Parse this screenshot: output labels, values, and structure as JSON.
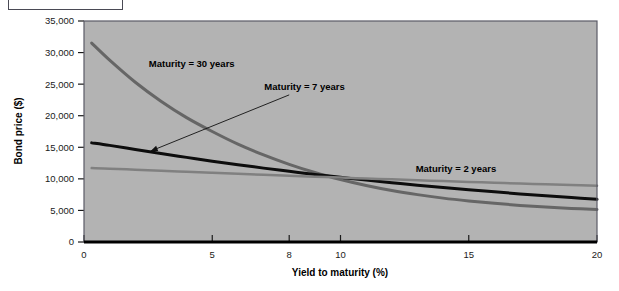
{
  "figure": {
    "background_color": "#ffffff",
    "plot_background_color": "#b3b3b3",
    "plot_border_color": "#5a5a66",
    "label_box_present": true
  },
  "chart_data": {
    "type": "line",
    "title": "",
    "xlabel": "Yield to maturity (%)",
    "ylabel": "Bond price ($)",
    "xlim": [
      0,
      20
    ],
    "ylim": [
      0,
      35000
    ],
    "xticks": [
      0,
      5,
      8,
      10,
      15,
      20
    ],
    "xticklabels": [
      "0",
      "5",
      "8",
      "10",
      "15",
      "20"
    ],
    "yticks": [
      0,
      5000,
      10000,
      15000,
      20000,
      25000,
      30000,
      35000
    ],
    "yticklabels": [
      "0",
      "5,000",
      "10,000",
      "15,000",
      "20,000",
      "25,000",
      "30,000",
      "35,000"
    ],
    "grid": false,
    "legend_position": "inline-annotations",
    "series": [
      {
        "name": "Maturity = 30 years",
        "color": "#666666",
        "line_width": 3,
        "label_x": 4.2,
        "label_y": 28200,
        "x": [
          0.3,
          1,
          2,
          3,
          4,
          5,
          6,
          7,
          8,
          9,
          10,
          11,
          12,
          13,
          14,
          15,
          16,
          17,
          18,
          19,
          20
        ],
        "y": [
          31500,
          28800,
          25300,
          22300,
          19700,
          17500,
          15500,
          13800,
          12300,
          11000,
          9900,
          8950,
          8150,
          7500,
          6950,
          6500,
          6120,
          5800,
          5540,
          5320,
          5150
        ]
      },
      {
        "name": "Maturity = 7 years",
        "color": "#0d0d0d",
        "line_width": 3,
        "label_x": 8.6,
        "label_y": 24600,
        "arrow_from_x": 8.0,
        "arrow_from_y": 23300,
        "arrow_to_x": 2.6,
        "arrow_to_y": 14400,
        "x": [
          0.3,
          1,
          2,
          3,
          4,
          5,
          6,
          7,
          8,
          9,
          10,
          11,
          12,
          13,
          14,
          15,
          16,
          17,
          18,
          19,
          20
        ],
        "y": [
          15700,
          15300,
          14650,
          14000,
          13400,
          12800,
          12250,
          11700,
          11200,
          10700,
          10250,
          9800,
          9400,
          9000,
          8620,
          8270,
          7940,
          7620,
          7320,
          7030,
          6760
        ]
      },
      {
        "name": "Maturity = 2 years",
        "color": "#808080",
        "line_width": 2.5,
        "label_x": 14.5,
        "label_y": 11700,
        "x": [
          0.3,
          1,
          2,
          3,
          4,
          5,
          6,
          7,
          8,
          9,
          10,
          11,
          12,
          13,
          14,
          15,
          16,
          17,
          18,
          19,
          20
        ],
        "y": [
          11700,
          11620,
          11450,
          11280,
          11120,
          10960,
          10800,
          10650,
          10500,
          10350,
          10200,
          10060,
          9920,
          9780,
          9650,
          9520,
          9390,
          9260,
          9140,
          9020,
          8900
        ]
      }
    ]
  }
}
